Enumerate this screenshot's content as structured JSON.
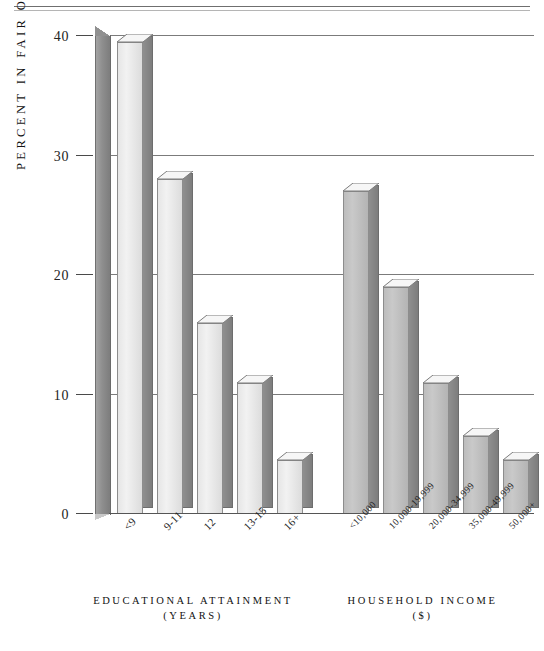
{
  "figure": {
    "y_axis_title": "PERCENT IN FAIR OR POOR HEALTH",
    "y_ticks": [
      "0",
      "10",
      "20",
      "30",
      "40"
    ],
    "group_captions": [
      {
        "title": "EDUCATIONAL ATTAINMENT",
        "sub": "(YEARS)"
      },
      {
        "title": "HOUSEHOLD INCOME",
        "sub": "($)"
      }
    ]
  },
  "chart_data": {
    "type": "bar",
    "title": "",
    "xlabel": "",
    "ylabel": "PERCENT IN FAIR OR POOR HEALTH",
    "ylim": [
      0,
      40
    ],
    "yticks": [
      0,
      10,
      20,
      30,
      40
    ],
    "grid": true,
    "legend": "none",
    "groups": [
      {
        "name": "EDUCATIONAL ATTAINMENT (YEARS)",
        "categories": [
          "<9",
          "9-11",
          "12",
          "13-15",
          "16+"
        ],
        "values": [
          39.5,
          28.0,
          16.0,
          11.0,
          4.5
        ]
      },
      {
        "name": "HOUSEHOLD INCOME ($)",
        "categories": [
          "<10,000",
          "10,000-19,999",
          "20,000-34,999",
          "35,000-49,999",
          "50,000+"
        ],
        "values": [
          27.0,
          19.0,
          11.0,
          6.5,
          4.5
        ]
      }
    ]
  }
}
